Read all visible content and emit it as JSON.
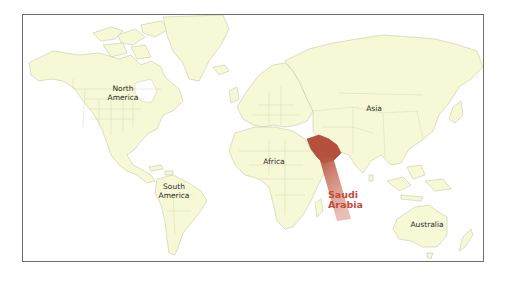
{
  "map": {
    "type": "world-political-outline",
    "land_color": "#f7f8d6",
    "ocean_color": "#ffffff",
    "frame_color": "#6e6e6e",
    "highlight_color": "#b5503c",
    "continent_labels": [
      {
        "id": "north-america",
        "text": "North\nAmerica"
      },
      {
        "id": "south-america",
        "text": "South\nAmerica"
      },
      {
        "id": "africa",
        "text": "Africa"
      },
      {
        "id": "asia",
        "text": "Asia"
      },
      {
        "id": "australia",
        "text": "Australia"
      }
    ],
    "highlighted_country": {
      "name": "Saudi Arabia",
      "label_line1": "Saudi",
      "label_line2": "Arabia",
      "color": "#c24a3a"
    }
  }
}
